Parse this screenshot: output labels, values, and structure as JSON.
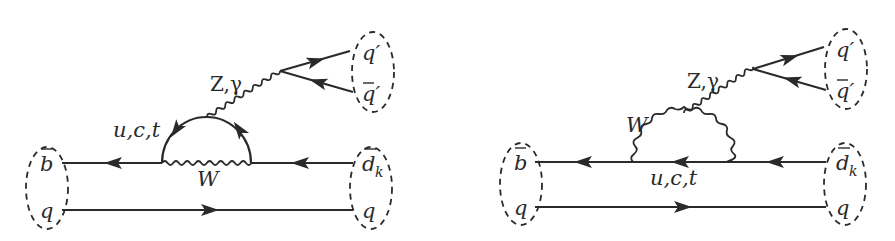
{
  "diagrams": [
    {
      "id": "left",
      "description": "Penguin diagram with internal up-type quark loop emitting Z/photon",
      "labels": {
        "in_top": "b",
        "in_bottom": "q",
        "out_top": "d",
        "out_top_sub": "k",
        "out_bottom": "q",
        "loop_quarks": "u,c,t",
        "loop_boson": "W",
        "neutral_boson": "Z,γ",
        "final_quark": "q′",
        "final_antiquark": "q′"
      }
    },
    {
      "id": "right",
      "description": "Penguin diagram with W loop emitting Z/photon",
      "labels": {
        "in_top": "b",
        "in_bottom": "q",
        "out_top": "d",
        "out_top_sub": "k",
        "out_bottom": "q",
        "loop_quarks": "u,c,t",
        "loop_boson": "W",
        "neutral_boson": "Z,γ",
        "final_quark": "q′",
        "final_antiquark": "q′"
      }
    }
  ],
  "colors": {
    "ink": "#2a2a2a",
    "background": "#ffffff"
  }
}
